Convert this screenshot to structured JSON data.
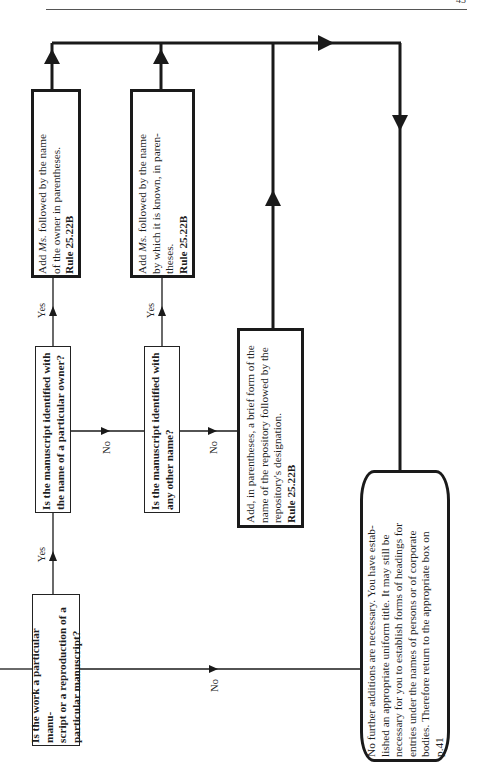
{
  "page": {
    "page_number": "43",
    "orientation": "rotated-90-ccw"
  },
  "flowchart": {
    "questions": [
      {
        "id": "q1",
        "text": "Is the work a particular manuscript or a reproduction of a particular manuscript?",
        "lines": [
          "Is the work a particular manu-",
          "script or a reproduction of a",
          "particular manuscript?"
        ]
      },
      {
        "id": "q2",
        "text": "Is the manuscript identified with the name of a particular owner?",
        "lines": [
          "Is the manuscript identified with",
          "the name of a particular owner?"
        ]
      },
      {
        "id": "q3",
        "text": "Is the manuscript identified with any other name?",
        "lines": [
          "Is the manuscript identified with",
          "any other name?"
        ]
      }
    ],
    "actions": [
      {
        "id": "a1",
        "pre": "Add ",
        "italic": "Ms.",
        "lines": [
          " followed by the name",
          "of the owner in parentheses."
        ],
        "rule": "Rule 25.22B"
      },
      {
        "id": "a2",
        "pre": "Add ",
        "italic": "Ms.",
        "lines": [
          " followed by the name",
          "by which it is known, in paren-",
          "theses."
        ],
        "rule": "Rule 25.22B"
      },
      {
        "id": "a3",
        "lines": [
          "Add, in parentheses, a brief form of the",
          "name of the repository followed by the",
          "repository's designation."
        ],
        "rule": "Rule 25.22B"
      }
    ],
    "terminal": {
      "lines": [
        "No further additions are necessary. You have estab-",
        "lished an appropriate uniform title. It may still be",
        "necessary for you to establish forms of headings for",
        "entries under the names of persons or of corporate",
        "bodies. Therefore return to the appropriate box on",
        "p.41"
      ]
    },
    "labels": {
      "yes": "Yes",
      "no": "No"
    }
  }
}
